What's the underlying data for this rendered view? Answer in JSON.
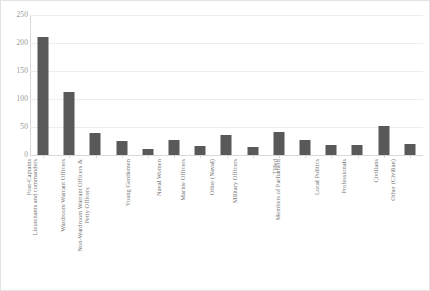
{
  "chart_data": {
    "type": "bar",
    "title": "",
    "subtitle": "",
    "xlabel": "",
    "ylabel": "",
    "ylim": [
      0,
      250
    ],
    "yticks": [
      0,
      50,
      100,
      150,
      200,
      250
    ],
    "grid": true,
    "legend": false,
    "legend_position": "none",
    "bar_color": "#595959",
    "gridline_color": "#eceded",
    "axis_color": "#d9d9d9",
    "tick_label_color": "#9a9a9a",
    "category_label_color": "#7a7a7a",
    "categories": [
      "Post-Captains",
      "Lieutenants and commanders",
      "Wardroom Warrant Officers",
      "Non-Wardroom Warrant Officers & Petty Officers",
      "Young Gentlemen",
      "Naval Women",
      "Marine Officers",
      "Other (Naval)",
      "Military Officers",
      "Titled",
      "Members of Parliament",
      "Local Politics",
      "Professionals",
      "Civilians",
      "Other (Civilian)"
    ],
    "category_lines": [
      [
        "Post-Captains"
      ],
      [
        "Lieutenants and commanders"
      ],
      [
        "Wardroom Warrant Officers"
      ],
      [
        "Non-Wardroom Warrant Officers &",
        "Petty Officers"
      ],
      [
        "Young Gentlemen"
      ],
      [
        "Naval Women"
      ],
      [
        "Marine Officers"
      ],
      [
        "Other (Naval)"
      ],
      [
        "Military Officers"
      ],
      [
        "Titled"
      ],
      [
        "Members of Parliament"
      ],
      [
        "Local Politics"
      ],
      [
        "Professionals"
      ],
      [
        "Civilians"
      ],
      [
        "Other (Civilian)"
      ]
    ],
    "values": [
      211,
      112,
      39,
      25,
      11,
      27,
      16,
      36,
      14,
      41,
      26,
      17,
      18,
      51,
      20
    ]
  }
}
